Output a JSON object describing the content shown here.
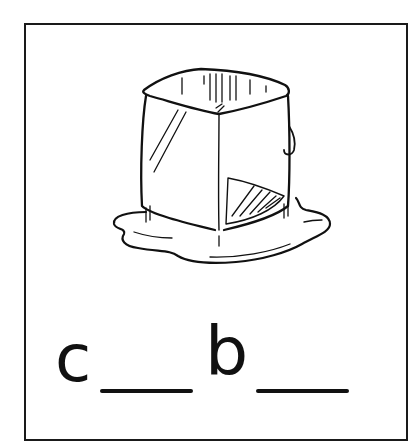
{
  "card": {
    "illustration": "ice-cube-melting",
    "illustration_alt": "Melting ice cube in a puddle of water",
    "word_puzzle": {
      "letters": [
        "c",
        "b"
      ],
      "blanks": 2,
      "pattern": "c__b__"
    }
  },
  "colors": {
    "ink": "#111111",
    "background": "#ffffff",
    "border": "#1a1a1a"
  }
}
